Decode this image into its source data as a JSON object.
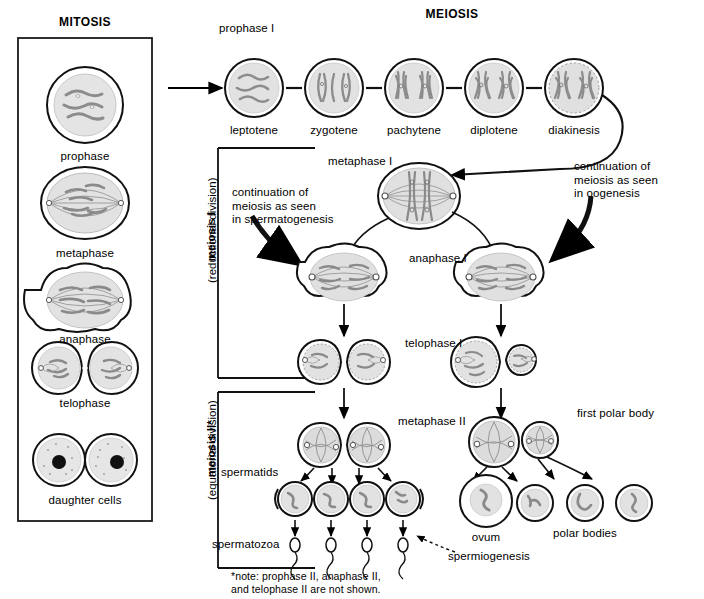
{
  "figure": {
    "title_left": "MITOSIS",
    "title_right": "MEIOSIS",
    "footnote": "*note: prophase II, anaphase II,\nand telophase II are not shown."
  },
  "mitosis": {
    "box_label": "MITOSIS",
    "stages": [
      {
        "label": "prophase"
      },
      {
        "label": "metaphase"
      },
      {
        "label": "anaphase"
      },
      {
        "label": "telophase"
      },
      {
        "label": "daughter cells"
      }
    ]
  },
  "meiosis": {
    "title": "MEIOSIS",
    "prophase_group_label": "prophase I",
    "prophase_stages": [
      {
        "label": "leptotene"
      },
      {
        "label": "zygotene"
      },
      {
        "label": "pachytene"
      },
      {
        "label": "diplotene"
      },
      {
        "label": "diakinesis"
      }
    ],
    "division_labels": [
      {
        "name": "meiosis I",
        "sub": "(reductional division)"
      },
      {
        "name": "meiosis II*",
        "sub": "(equatorial division)"
      }
    ],
    "annotations": {
      "spermatogenesis_note": "continuation of\nmeiosis as seen\nin spermatogenesis",
      "oogenesis_note": "continuation of\nmeiosis as seen\nin oogenesis"
    },
    "stage_labels": {
      "metaphase_I": "metaphase I",
      "anaphase_I": "anaphase I",
      "telophase_I": "telophase I",
      "metaphase_II": "metaphase II"
    },
    "male_products": {
      "spermatids": "spermatids",
      "spermatozoa": "spermatozoa",
      "spermiogenesis": "spermiogenesis"
    },
    "female_products": {
      "first_polar_body": "first polar body",
      "ovum": "ovum",
      "polar_bodies": "polar bodies"
    }
  },
  "colors": {
    "outline": "#000000",
    "cytoplasm": "#e4e4e4",
    "cytoplasm_dark": "#d8d8d8",
    "chromatin": "#8c8c8c",
    "nucleus": "#111111",
    "background": "#ffffff"
  }
}
